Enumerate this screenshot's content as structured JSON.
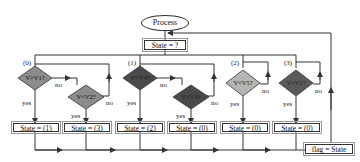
{
  "start": {
    "label": "Process"
  },
  "state_check": {
    "label": "State = ?"
  },
  "branches": [
    {
      "id": "(0)",
      "decisions": [
        {
          "label": "V>V1?",
          "color": "#8c8c8c",
          "yes": "yes",
          "no": "no"
        },
        {
          "label": "V<V2?",
          "color": "#8c8c8c",
          "yes": "yes",
          "no": "no"
        }
      ],
      "results": [
        "State = (1)",
        "State = (3)"
      ]
    },
    {
      "id": "(1)",
      "decisions": [
        {
          "label": "V<V4?",
          "color": "#4a4a4a",
          "yes": "yes",
          "no": "no"
        },
        {
          "label": "V<V3?",
          "color": "#4a4a4a",
          "yes": "yes",
          "no": "no"
        }
      ],
      "results": [
        "State = (2)",
        "State = (0)"
      ]
    },
    {
      "id": "(2)",
      "decisions": [
        {
          "label": "V<V5?",
          "color": "#b5b5b5",
          "yes": "yes",
          "no": "no"
        }
      ],
      "results": [
        "State = (0)"
      ]
    },
    {
      "id": "(3)",
      "decisions": [
        {
          "label": "V>V2?",
          "color": "#5a5a5a",
          "yes": "yes",
          "no": "no"
        }
      ],
      "results": [
        "State = (0)"
      ]
    }
  ],
  "end": {
    "label": "flag = State"
  },
  "colors": {
    "line": "#333333",
    "background": "#ffffff"
  }
}
